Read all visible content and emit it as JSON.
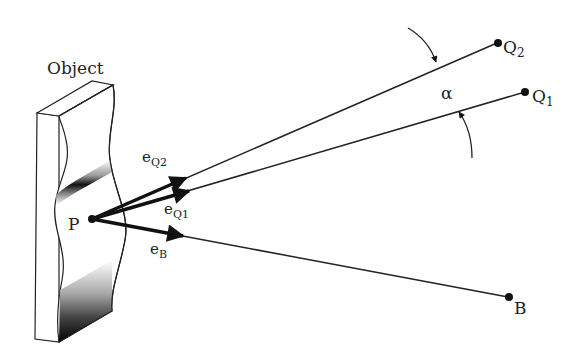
{
  "diagram": {
    "object_label": "Object",
    "point_P": "P",
    "vectors": [
      {
        "id": "eQ2",
        "base": "e",
        "sub": "Q2"
      },
      {
        "id": "eQ1",
        "base": "e",
        "sub": "Q1"
      },
      {
        "id": "eB",
        "base": "e",
        "sub": "B"
      }
    ],
    "points": [
      {
        "id": "Q2",
        "base": "Q",
        "sub": "2"
      },
      {
        "id": "Q1",
        "base": "Q",
        "sub": "1"
      },
      {
        "id": "B",
        "base": "B",
        "sub": ""
      }
    ],
    "angle_label": "α",
    "colors": {
      "line": "#222222",
      "background": "#ffffff"
    }
  }
}
